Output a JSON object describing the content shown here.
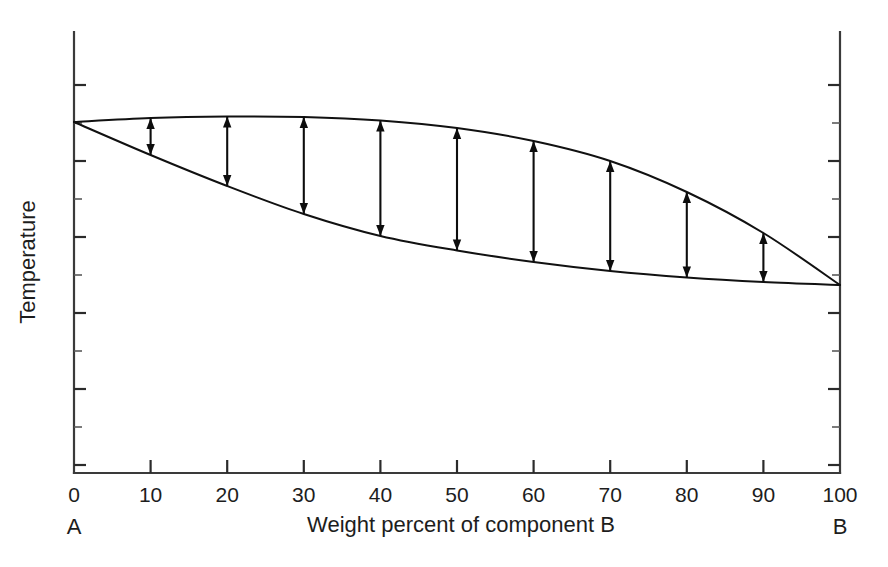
{
  "chart_data": {
    "type": "line",
    "title": "",
    "xlabel": "Weight percent of component B",
    "ylabel": "Temperature",
    "xlim": [
      0,
      100
    ],
    "ylim": [
      0,
      100
    ],
    "grid": false,
    "legend": "none",
    "x_ticks": [
      "0",
      "10",
      "20",
      "30",
      "40",
      "50",
      "60",
      "70",
      "80",
      "90",
      "100"
    ],
    "x_tick_values": [
      0,
      10,
      20,
      30,
      40,
      50,
      60,
      70,
      80,
      90,
      100
    ],
    "y_ticks_labeled": false,
    "y_tick_count": 11,
    "left_end_label": "A",
    "right_end_label": "B",
    "series": [
      {
        "name": "liquidus",
        "x": [
          0,
          10,
          20,
          30,
          40,
          50,
          60,
          70,
          80,
          90,
          100
        ],
        "y_px": [
          122,
          118,
          116.5,
          117,
          120.5,
          128,
          141,
          161,
          192,
          233,
          285
        ]
      },
      {
        "name": "solidus",
        "x": [
          0,
          10,
          20,
          30,
          40,
          50,
          60,
          70,
          80,
          90,
          100
        ],
        "y_px": [
          122,
          155,
          186,
          214,
          236,
          250.5,
          262,
          271,
          277.5,
          282,
          285
        ]
      }
    ],
    "annotations": {
      "kind": "tie-line-double-arrows",
      "description": "Vertical double-headed arrows connecting liquidus and solidus at each 10 weight-percent interval",
      "at_x": [
        10,
        20,
        30,
        40,
        50,
        60,
        70,
        80,
        90
      ],
      "count": 9
    },
    "colors": {
      "background": "#ffffff",
      "curve": "#111111",
      "axis": "#3a3a3a",
      "arrow": "#0d0d0d",
      "text": "#1d1d1d"
    }
  },
  "plot_geometry": {
    "left_px": 74,
    "right_px": 840,
    "top_px": 32,
    "bottom_px": 473
  }
}
